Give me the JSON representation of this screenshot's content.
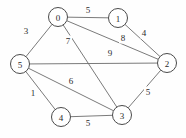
{
  "figure": {
    "type": "undirected-weighted-graph",
    "background_color": "#fefefe",
    "node_fill": "#ffffff",
    "node_stroke": "#4a4a4a",
    "edge_color": "#6b6b6b",
    "text_color": "#2b2b2b",
    "width": 186,
    "height": 138
  },
  "chart_data": {
    "type": "diagram",
    "title": "",
    "nodes": [
      {
        "id": "0",
        "label": "0",
        "x": 58,
        "y": 17,
        "r": 9.5
      },
      {
        "id": "1",
        "label": "1",
        "x": 118,
        "y": 18,
        "r": 9.5
      },
      {
        "id": "2",
        "label": "2",
        "x": 167,
        "y": 63,
        "r": 9.5
      },
      {
        "id": "3",
        "label": "3",
        "x": 122,
        "y": 115,
        "r": 9.5
      },
      {
        "id": "4",
        "label": "4",
        "x": 61,
        "y": 117,
        "r": 9.5
      },
      {
        "id": "5",
        "label": "5",
        "x": 20,
        "y": 64,
        "r": 9.5
      }
    ],
    "edges": [
      {
        "source": "0",
        "target": "1",
        "weight": "5",
        "lx": 88,
        "ly": 10
      },
      {
        "source": "0",
        "target": "5",
        "weight": "3",
        "lx": 26,
        "ly": 31
      },
      {
        "source": "0",
        "target": "2",
        "weight": "8",
        "lx": 123,
        "ly": 38
      },
      {
        "source": "0",
        "target": "3",
        "weight": "7",
        "lx": 68,
        "ly": 41
      },
      {
        "source": "1",
        "target": "2",
        "weight": "4",
        "lx": 144,
        "ly": 33
      },
      {
        "source": "5",
        "target": "2",
        "weight": "9",
        "lx": 110,
        "ly": 53
      },
      {
        "source": "5",
        "target": "3",
        "weight": "6",
        "lx": 71,
        "ly": 81
      },
      {
        "source": "5",
        "target": "4",
        "weight": "1",
        "lx": 33,
        "ly": 93
      },
      {
        "source": "4",
        "target": "3",
        "weight": "5",
        "lx": 88,
        "ly": 123
      },
      {
        "source": "3",
        "target": "2",
        "weight": "5",
        "lx": 148,
        "ly": 92
      }
    ]
  }
}
